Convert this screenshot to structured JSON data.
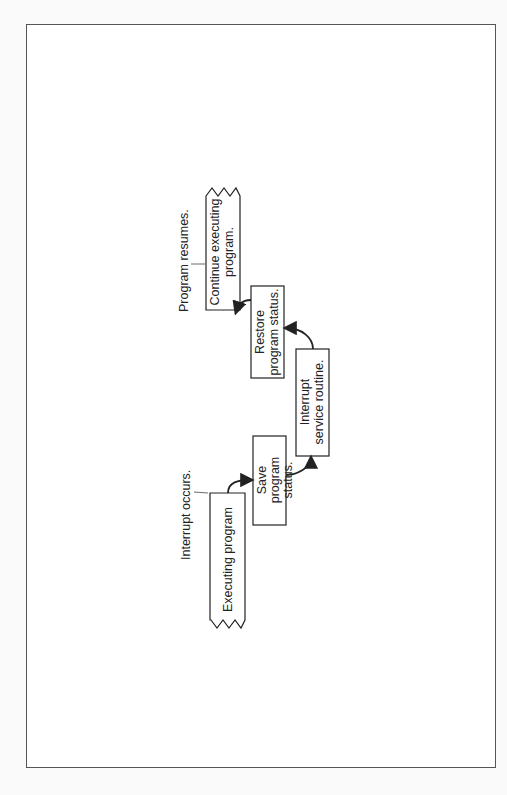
{
  "diagram": {
    "orientation": "rotated-90-ccw",
    "annotations": {
      "interrupt_occurs": "Interrupt occurs.",
      "program_resumes": "Program resumes."
    },
    "boxes": [
      {
        "id": "executing",
        "line1": "Executing program",
        "line2": ""
      },
      {
        "id": "save",
        "line1": "Save",
        "line2": "program",
        "line3": "status."
      },
      {
        "id": "isr",
        "line1": "Interrupt",
        "line2": "service routine."
      },
      {
        "id": "restore",
        "line1": "Restore",
        "line2": "program status."
      },
      {
        "id": "continue",
        "line1": "Continue executing",
        "line2": "program."
      }
    ]
  }
}
